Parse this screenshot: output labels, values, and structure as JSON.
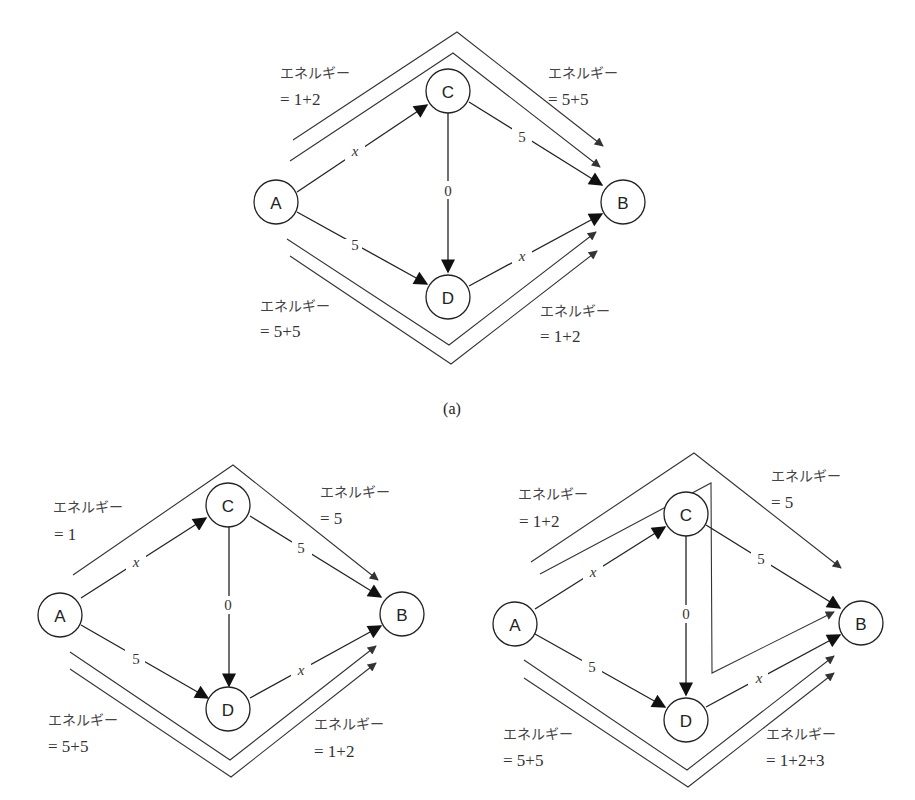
{
  "caption_a": "(a)",
  "energy_label": "エネルギー",
  "diagrams": [
    {
      "id": "a",
      "nodes": {
        "A": "A",
        "B": "B",
        "C": "C",
        "D": "D"
      },
      "weights": {
        "AC": "x",
        "AD": "5",
        "CB": "5",
        "DB": "x",
        "CD": "0"
      },
      "energies": {
        "top_left": "= 1+2",
        "top_right": "=  5+5",
        "bottom_left": "= 5+5",
        "bottom_right": "=  1+2"
      }
    },
    {
      "id": "b-left",
      "nodes": {
        "A": "A",
        "B": "B",
        "C": "C",
        "D": "D"
      },
      "weights": {
        "AC": "x",
        "AD": "5",
        "CB": "5",
        "DB": "x",
        "CD": "0"
      },
      "energies": {
        "top_left": "=  1",
        "top_right": "=  5",
        "bottom_left": "=  5+5",
        "bottom_right": "= 1+2"
      }
    },
    {
      "id": "b-right",
      "nodes": {
        "A": "A",
        "B": "B",
        "C": "C",
        "D": "D"
      },
      "weights": {
        "AC": "x",
        "AD": "5",
        "CB": "5",
        "DB": "x",
        "CD": "0"
      },
      "energies": {
        "top_left": "= 1+2",
        "top_right": "=  5",
        "bottom_left": "=  5+5",
        "bottom_right": "=  1+2+3"
      }
    }
  ]
}
